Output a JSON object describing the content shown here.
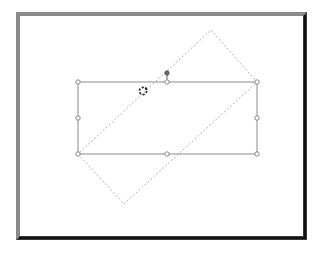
{
  "scene": {
    "description": "Shape being rotated: solid selection rectangle with handles and dashed rotated preview outline",
    "colors": {
      "frame_light": "#8a8a8a",
      "frame_dark": "#3a3a3a",
      "shape_outline": "#8c8c8c",
      "preview_dash": "#b0b0b0",
      "handle_fill": "#ffffff",
      "handle_stroke": "#7a7a7a",
      "rotation_handle": "#6a6a6a",
      "cursor": "#222222"
    },
    "selection_rect": {
      "x1": 78,
      "y1": 82,
      "x2": 257,
      "y2": 154
    },
    "rotated_preview": {
      "points": [
        [
          211,
          30
        ],
        [
          257,
          82
        ],
        [
          124,
          204
        ],
        [
          78,
          154
        ]
      ]
    },
    "handles": [
      {
        "name": "top-left",
        "x": 78,
        "y": 82
      },
      {
        "name": "top-middle",
        "x": 167,
        "y": 82
      },
      {
        "name": "top-right",
        "x": 257,
        "y": 82
      },
      {
        "name": "middle-left",
        "x": 78,
        "y": 118
      },
      {
        "name": "middle-right",
        "x": 257,
        "y": 118
      },
      {
        "name": "bottom-left",
        "x": 78,
        "y": 154
      },
      {
        "name": "bottom-middle",
        "x": 167,
        "y": 154
      },
      {
        "name": "bottom-right",
        "x": 257,
        "y": 154
      }
    ],
    "rotation_handle": {
      "x": 167,
      "y": 73
    },
    "cursor": {
      "type": "rotate-cursor",
      "x": 143,
      "y": 91
    }
  }
}
